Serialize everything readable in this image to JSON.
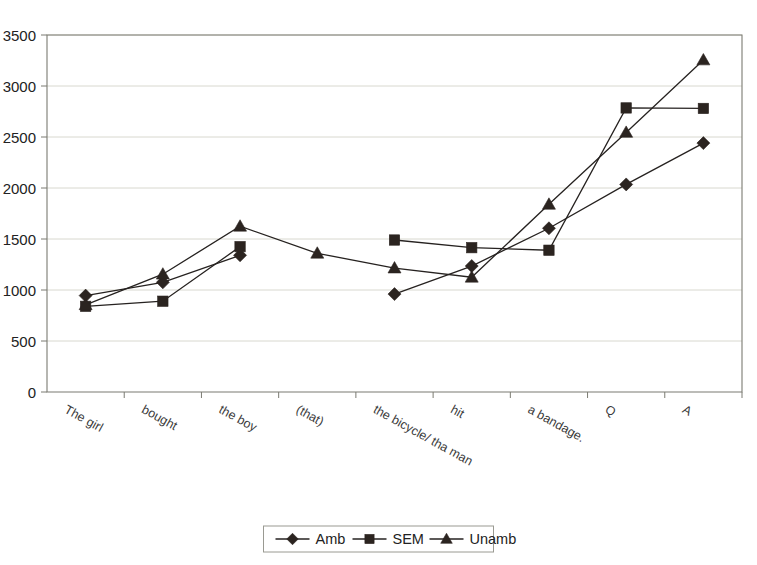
{
  "chart_data": {
    "type": "line",
    "title": "",
    "xlabel": "",
    "ylabel": "",
    "ylim": [
      0,
      3500
    ],
    "ytick_values": [
      0,
      500,
      1000,
      1500,
      2000,
      2500,
      3000,
      3500
    ],
    "ytick_labels": [
      "0",
      "500",
      "1000",
      "1500",
      "2000",
      "2500",
      "3000",
      "3500"
    ],
    "grid": true,
    "legend_position": "bottom",
    "categories": [
      "The girl",
      "bought",
      "the boy",
      "(that)",
      "the bicycle/ tha man",
      "hit",
      "a bandage.",
      "Q",
      "A"
    ],
    "series": [
      {
        "name": "Amb",
        "marker": "diamond",
        "color": "#2b2420",
        "values": [
          945,
          1075,
          1340,
          null,
          960,
          1235,
          1605,
          2035,
          2440
        ]
      },
      {
        "name": "SEM",
        "marker": "square",
        "color": "#2b2420",
        "values": [
          840,
          890,
          1425,
          null,
          1490,
          1415,
          1390,
          2785,
          2780
        ]
      },
      {
        "name": "Unamb",
        "marker": "triangle",
        "color": "#2b2420",
        "values": [
          855,
          1155,
          1625,
          1360,
          1215,
          1125,
          1840,
          2545,
          3255
        ]
      }
    ]
  },
  "legend": {
    "items": [
      {
        "label": "Amb",
        "marker": "diamond"
      },
      {
        "label": "SEM",
        "marker": "square"
      },
      {
        "label": "Unamb",
        "marker": "triangle"
      }
    ]
  }
}
